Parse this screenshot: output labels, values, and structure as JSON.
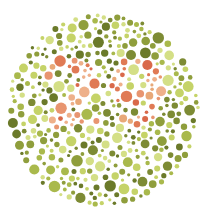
{
  "plate": {
    "type": "ishihara-color-test",
    "number_shown": "29",
    "center": [
      103,
      110
    ],
    "radius": 96,
    "colors": {
      "background": "#ffffff",
      "figure": [
        "#e07a55",
        "#e89570",
        "#eeb08a",
        "#d9694a",
        "#e8a878"
      ],
      "ground": [
        "#6b7a2a",
        "#7d8b34",
        "#a9b94c",
        "#c5d368",
        "#d4df86",
        "#8f9e3c"
      ]
    }
  }
}
